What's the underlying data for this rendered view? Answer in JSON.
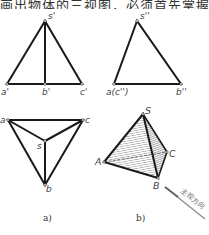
{
  "header_text": "画出物体的三视图，必须首先掌握",
  "figure_a": {
    "caption": "a)",
    "front_view": {
      "labels": {
        "apex": "s'",
        "left": "a'",
        "mid": "b'",
        "right": "c'"
      }
    },
    "side_view": {
      "labels": {
        "apex": "s''",
        "left": "a(c'')",
        "right": "b''"
      }
    },
    "top_view": {
      "labels": {
        "left": "a",
        "right": "c",
        "center": "s",
        "bottom": "b"
      }
    }
  },
  "figure_b": {
    "caption": "b)",
    "labels": {
      "apex": "S",
      "left": "A",
      "right": "C",
      "bottom": "B"
    },
    "direction_label": "主视方向"
  },
  "colors": {
    "line": "#1a1a1a",
    "hatch": "#8a8a8a",
    "text": "#444444",
    "arrow": "#888888"
  }
}
